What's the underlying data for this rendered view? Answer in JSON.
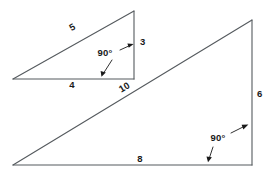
{
  "figure": {
    "kind": "geometry-diagram",
    "background_color": "#ffffff",
    "line_color": "#555a5e",
    "label_color": "#1a1a1a"
  },
  "shapes": [
    {
      "id": "small-triangle",
      "name": "small-right-triangle",
      "vertices": {
        "left": [
          13,
          79
        ],
        "top": [
          134,
          11
        ],
        "corner": [
          134,
          79
        ]
      },
      "labels": {
        "hypotenuse": "5",
        "vertical_leg": "3",
        "horizontal_leg": "4",
        "right_angle": "90°"
      },
      "label_positions": {
        "hypotenuse": [
          74,
          30
        ],
        "vertical_leg": [
          140,
          42
        ],
        "horizontal_leg": [
          72,
          83
        ],
        "right_angle": [
          105,
          58
        ]
      }
    },
    {
      "id": "large-triangle",
      "name": "large-right-triangle",
      "vertices": {
        "left": [
          13,
          165
        ],
        "top": [
          252,
          20
        ],
        "corner": [
          252,
          165
        ]
      },
      "labels": {
        "hypotenuse": "10",
        "vertical_leg": "6",
        "horizontal_leg": "8",
        "right_angle": "90°"
      },
      "label_positions": {
        "hypotenuse": [
          126,
          92
        ],
        "vertical_leg": [
          258,
          94
        ],
        "horizontal_leg": [
          140,
          166
        ],
        "right_angle": [
          218,
          143
        ]
      }
    }
  ]
}
